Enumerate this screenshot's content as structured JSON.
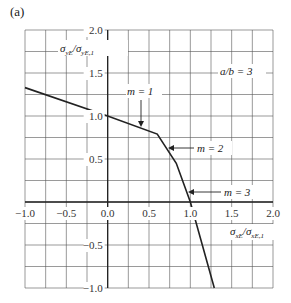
{
  "panel_label": "(a)",
  "annotation_ratio": "a/b = 3",
  "chart_data": {
    "type": "line",
    "title": "",
    "panel": "(a)",
    "xlabel": "σxE/σxE,1",
    "ylabel": "σyE/σyE,1",
    "xlim": [
      -1.0,
      2.0
    ],
    "ylim": [
      -1.0,
      2.0
    ],
    "x_ticks": [
      "-1.0",
      "-0.5",
      "0.0",
      "0.5",
      "1.0",
      "1.5",
      "2.0"
    ],
    "y_ticks": [
      "2.0",
      "1.5",
      "1.0",
      "0.5",
      "-0.5",
      "-1.0"
    ],
    "grid": true,
    "grid_step": 0.25,
    "series": [
      {
        "name": "interaction curve a/b = 3",
        "x": [
          -1.0,
          0.0,
          0.6,
          0.83,
          1.0,
          1.29
        ],
        "y": [
          1.33,
          1.0,
          0.79,
          0.45,
          0.0,
          -1.0
        ]
      }
    ],
    "annotations": [
      {
        "text": "m = 1",
        "arrow_to": [
          0.4,
          0.86
        ]
      },
      {
        "text": "m = 2",
        "arrow_to": [
          0.73,
          0.63
        ]
      },
      {
        "text": "m = 3",
        "arrow_to": [
          0.97,
          0.12
        ]
      },
      {
        "text": "a/b = 3",
        "position": [
          1.55,
          1.5
        ]
      }
    ]
  },
  "labels": {
    "y_axis_main": "σ",
    "y_axis_sub1": "yE",
    "y_axis_slash": "/σ",
    "y_axis_sub2": "yE,1",
    "x_axis_main": "σ",
    "x_axis_sub1": "xE",
    "x_axis_slash": "/σ",
    "x_axis_sub2": "xE,1",
    "m1": "m = 1",
    "m2": "m = 2",
    "m3": "m = 3"
  }
}
